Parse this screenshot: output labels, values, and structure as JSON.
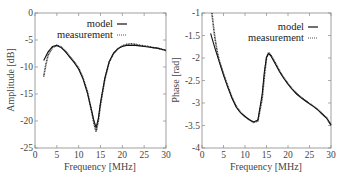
{
  "chart_data": [
    {
      "type": "line",
      "title": "",
      "xlabel": "Frequency [MHz]",
      "ylabel": "Amplitude [dB]",
      "xlim": [
        0,
        30
      ],
      "ylim": [
        -25,
        0
      ],
      "xticks": [
        0,
        5,
        10,
        15,
        20,
        25,
        30
      ],
      "yticks": [
        0,
        -5,
        -10,
        -15,
        -20,
        -25
      ],
      "xtick_labels": [
        "0",
        "5",
        "10",
        "15",
        "20",
        "25",
        "30"
      ],
      "ytick_labels": [
        "0",
        "-5",
        "-10",
        "-15",
        "-20",
        "-25"
      ],
      "grid": false,
      "legend_position": "upper right",
      "series": [
        {
          "name": "model",
          "style": "solid",
          "x": [
            2,
            3,
            4,
            5,
            6,
            7,
            8,
            9,
            10,
            11,
            12,
            13,
            13.5,
            14,
            14.5,
            15,
            16,
            17,
            18,
            19,
            20,
            21,
            22,
            23,
            24,
            25,
            26,
            27,
            28,
            29,
            30
          ],
          "y": [
            -8.8,
            -7.2,
            -6.2,
            -6.0,
            -6.4,
            -7.2,
            -8.2,
            -9.2,
            -10.4,
            -12.2,
            -14.8,
            -18.2,
            -20.0,
            -21.2,
            -19.6,
            -16.6,
            -12.0,
            -9.0,
            -7.4,
            -6.6,
            -6.2,
            -6.0,
            -6.0,
            -6.0,
            -6.1,
            -6.2,
            -6.3,
            -6.4,
            -6.5,
            -6.7,
            -6.9
          ]
        },
        {
          "name": "measurement",
          "style": "dotted",
          "x": [
            2,
            2.5,
            3,
            4,
            5,
            6,
            7,
            8,
            9,
            10,
            11,
            12,
            13,
            13.5,
            14,
            14.5,
            15,
            16,
            17,
            18,
            19,
            20,
            21,
            22,
            23,
            24,
            25,
            26,
            27,
            28,
            29,
            30
          ],
          "y": [
            -11.8,
            -9.5,
            -7.8,
            -6.4,
            -6.0,
            -6.3,
            -7.1,
            -8.1,
            -9.1,
            -10.2,
            -12.0,
            -14.6,
            -18.4,
            -20.5,
            -22.0,
            -20.0,
            -17.0,
            -12.2,
            -9.1,
            -7.5,
            -6.6,
            -6.1,
            -5.8,
            -5.7,
            -5.8,
            -6.0,
            -6.1,
            -6.2,
            -6.4,
            -6.5,
            -6.7,
            -7.0
          ]
        }
      ]
    },
    {
      "type": "line",
      "title": "",
      "xlabel": "Frequency [MHz]",
      "ylabel": "Phase [rad]",
      "xlim": [
        0,
        30
      ],
      "ylim": [
        -4,
        -1
      ],
      "xticks": [
        0,
        5,
        10,
        15,
        20,
        25,
        30
      ],
      "yticks": [
        -1,
        -1.5,
        -2,
        -2.5,
        -3,
        -3.5,
        -4
      ],
      "xtick_labels": [
        "0",
        "5",
        "10",
        "15",
        "20",
        "25",
        "30"
      ],
      "ytick_labels": [
        "-1",
        "-1.5",
        "-2",
        "-2.5",
        "-3",
        "-3.5",
        "-4"
      ],
      "grid": false,
      "legend_position": "upper right",
      "series": [
        {
          "name": "model",
          "style": "solid",
          "x": [
            2,
            3,
            4,
            5,
            6,
            7,
            8,
            9,
            10,
            11,
            12,
            13,
            14,
            14.5,
            15,
            15.5,
            16,
            17,
            18,
            19,
            20,
            21,
            22,
            23,
            24,
            25,
            26,
            27,
            28,
            29,
            30
          ],
          "y": [
            -1.45,
            -1.78,
            -2.08,
            -2.38,
            -2.65,
            -2.9,
            -3.1,
            -3.22,
            -3.3,
            -3.37,
            -3.42,
            -3.38,
            -2.8,
            -2.3,
            -1.98,
            -1.9,
            -1.95,
            -2.12,
            -2.3,
            -2.45,
            -2.58,
            -2.7,
            -2.8,
            -2.88,
            -2.95,
            -3.02,
            -3.08,
            -3.16,
            -3.25,
            -3.34,
            -3.48
          ]
        },
        {
          "name": "measurement",
          "style": "dotted",
          "x": [
            2.3,
            2.6,
            3,
            3.5,
            4,
            5,
            6,
            7,
            8,
            9,
            10,
            11,
            12,
            13,
            14,
            14.5,
            15,
            15.5,
            16,
            17,
            18,
            19,
            20,
            21,
            22,
            23,
            24,
            25,
            26,
            27,
            28,
            29,
            30
          ],
          "y": [
            -1.0,
            -1.25,
            -1.55,
            -1.85,
            -2.05,
            -2.35,
            -2.62,
            -2.88,
            -3.08,
            -3.21,
            -3.3,
            -3.37,
            -3.43,
            -3.4,
            -2.9,
            -2.4,
            -2.0,
            -1.88,
            -1.93,
            -2.1,
            -2.28,
            -2.44,
            -2.57,
            -2.69,
            -2.79,
            -2.87,
            -2.94,
            -3.01,
            -3.08,
            -3.15,
            -3.24,
            -3.33,
            -3.5
          ]
        }
      ]
    }
  ],
  "plots": [
    {
      "xlabel": "Frequency [MHz]",
      "ylabel": "Amplitude [dB]",
      "legend": [
        {
          "label": "model"
        },
        {
          "label": "measurement"
        }
      ]
    },
    {
      "xlabel": "Frequency [MHz]",
      "ylabel": "Phase [rad]",
      "legend": [
        {
          "label": "model"
        },
        {
          "label": "measurement"
        }
      ]
    }
  ]
}
